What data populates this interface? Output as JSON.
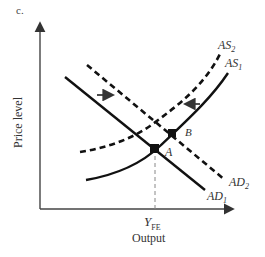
{
  "panel_label": "c.",
  "axes": {
    "ylabel": "Price level",
    "xlabel": "Output",
    "x_tick": {
      "main": "Y",
      "sub": "FE"
    }
  },
  "curves": {
    "as2": {
      "main": "AS",
      "sub": "2",
      "style": "dashed"
    },
    "as1": {
      "main": "AS",
      "sub": "1",
      "style": "solid"
    },
    "ad2": {
      "main": "AD",
      "sub": "2",
      "style": "dashed"
    },
    "ad1": {
      "main": "AD",
      "sub": "1",
      "style": "solid"
    }
  },
  "points": {
    "a": "A",
    "b": "B"
  },
  "arrows": {
    "ad_shift": "right",
    "as_shift": "left"
  },
  "colors": {
    "line": "#111111",
    "guide": "#888888",
    "text": "#333333"
  }
}
